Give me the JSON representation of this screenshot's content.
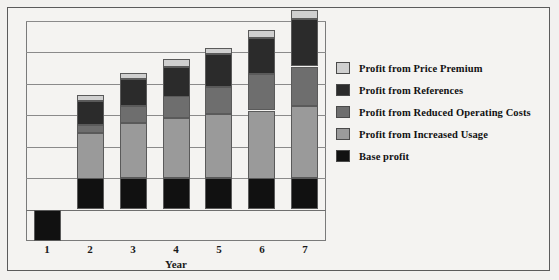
{
  "chart_data": {
    "type": "bar",
    "subtype": "stacked-bar",
    "title": "",
    "xlabel": "Year",
    "ylabel": "",
    "categories": [
      "1",
      "2",
      "3",
      "4",
      "5",
      "6",
      "7"
    ],
    "x_tick_labels": [
      "1",
      "2",
      "3",
      "4",
      "5",
      "6",
      "7"
    ],
    "ylim": [
      -1,
      6
    ],
    "y_tick_labels": [],
    "gridlines": {
      "visible": true,
      "y_values": [
        0,
        1,
        2,
        3,
        4,
        5,
        6
      ],
      "zero_line": 0
    },
    "legend_position": "right",
    "series": [
      {
        "name": "Base profit",
        "color": "#111111",
        "values": [
          -1.0,
          1.0,
          1.0,
          1.0,
          1.0,
          1.0,
          1.0
        ]
      },
      {
        "name": "Profit from Increased Usage",
        "color": "#9a9a9a",
        "values": [
          0,
          1.45,
          1.75,
          1.9,
          2.05,
          2.15,
          2.3
        ]
      },
      {
        "name": "Profit from Reduced Operating Costs",
        "color": "#6e6e6e",
        "values": [
          0,
          0.25,
          0.55,
          0.7,
          0.85,
          1.15,
          1.25
        ]
      },
      {
        "name": "Profit from References",
        "color": "#2b2b2b",
        "values": [
          0,
          0.75,
          0.85,
          0.95,
          1.05,
          1.15,
          1.5
        ]
      },
      {
        "name": "Profit from Price Premium",
        "color": "#cfcfcf",
        "values": [
          0,
          0.2,
          0.2,
          0.25,
          0.2,
          0.25,
          0.3
        ]
      }
    ]
  },
  "legend": {
    "items": [
      {
        "label": "Profit from Price Premium",
        "color": "#cfcfcf"
      },
      {
        "label": "Profit from References",
        "color": "#2b2b2b"
      },
      {
        "label": "Profit from Reduced Operating Costs",
        "color": "#6e6e6e"
      },
      {
        "label": "Profit from Increased Usage",
        "color": "#9a9a9a"
      },
      {
        "label": "Base profit",
        "color": "#111111"
      }
    ]
  },
  "axis": {
    "x_title": "Year"
  },
  "colors": {
    "background": "#f2f1ef",
    "figure_background": "#f4f3f1",
    "frame_border": "#5b5b5b",
    "plot_border": "#7a7a7a",
    "gridline": "#8a8a8a",
    "text": "#111111"
  }
}
